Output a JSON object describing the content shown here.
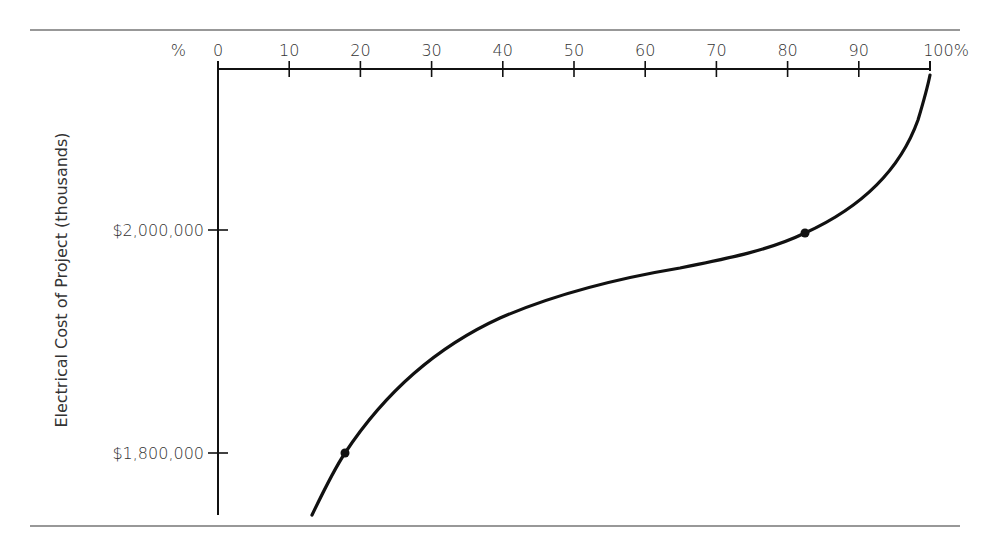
{
  "chart_data": {
    "type": "line",
    "title": "",
    "xlabel": "%",
    "ylabel": "Electrical Cost of Project (thousands)",
    "x_axis_position": "top",
    "x_ticks": [
      "0",
      "10",
      "20",
      "30",
      "40",
      "50",
      "60",
      "70",
      "80",
      "90",
      "100%"
    ],
    "x_unit_label": "%",
    "y_ticks": [
      "$2,000,000",
      "$1,800,000"
    ],
    "xlim": [
      0,
      100
    ],
    "ylim": [
      1740000,
      2140000
    ],
    "grid": false,
    "legend": null,
    "series": [
      {
        "name": "Cumulative probability curve",
        "x": [
          13,
          18,
          25,
          33,
          45,
          60,
          70,
          82,
          90,
          96,
          100
        ],
        "y": [
          1745000,
          1800000,
          1850000,
          1892000,
          1930000,
          1957000,
          1973000,
          2000000,
          2030000,
          2080000,
          2135000
        ]
      }
    ],
    "highlight_points": [
      {
        "x": 18,
        "y": 1800000
      },
      {
        "x": 82,
        "y": 2000000
      }
    ]
  }
}
